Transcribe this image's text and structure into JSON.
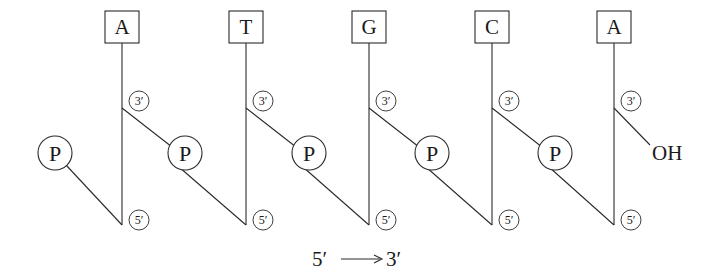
{
  "diagram": {
    "nucleotides": [
      {
        "base": "A",
        "x": 122
      },
      {
        "base": "T",
        "x": 246
      },
      {
        "base": "G",
        "x": 369
      },
      {
        "base": "C",
        "x": 492
      },
      {
        "base": "A",
        "x": 614
      }
    ],
    "phosphate_label": "P",
    "three_prime_label": "3′",
    "five_prime_label": "5′",
    "terminal_group": "OH",
    "direction": {
      "start": "5′",
      "end": "3′"
    }
  }
}
